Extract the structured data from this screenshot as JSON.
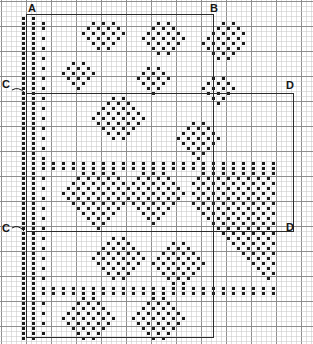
{
  "chart": {
    "type": "needlework-grid-chart",
    "width_px": 313,
    "height_px": 344,
    "cell_px": 5,
    "heavy_line_every": 5,
    "colors": {
      "background": "#ffffff",
      "fine_grid": "#c9c9c9",
      "heavy_grid": "#8a8a8a",
      "stitch": "#1a1a1a",
      "outline": "#2b2b2b",
      "label": "#161616"
    },
    "grid": {
      "cols": 62,
      "rows": 68,
      "origin_x": 1,
      "origin_y": 1
    }
  },
  "labels": [
    {
      "id": "label-a",
      "text": "A",
      "x": 28,
      "y": 3,
      "leader": null
    },
    {
      "id": "label-b",
      "text": "B",
      "x": 210,
      "y": 3,
      "leader": null
    },
    {
      "id": "label-c-top",
      "text": "C",
      "x": 2,
      "y": 79,
      "leader": {
        "x1": 12,
        "y1": 90,
        "x2": 25,
        "y2": 93
      }
    },
    {
      "id": "label-d-top",
      "text": "D",
      "x": 286,
      "y": 80,
      "leader": null
    },
    {
      "id": "label-c-bottom",
      "text": "C",
      "x": 2,
      "y": 223,
      "leader": {
        "x1": 12,
        "y1": 228,
        "x2": 24,
        "y2": 231
      }
    },
    {
      "id": "label-d-bottom",
      "text": "D",
      "x": 286,
      "y": 222,
      "leader": null
    }
  ],
  "outlines": [
    {
      "id": "outline-main-upper",
      "x": 26,
      "y": 14,
      "w": 187,
      "h": 79
    },
    {
      "id": "outline-middle-left",
      "x": 26,
      "y": 93,
      "w": 187,
      "h": 138
    },
    {
      "id": "outline-right-block",
      "x": 213,
      "y": 93,
      "w": 80,
      "h": 138
    },
    {
      "id": "outline-lower-left",
      "x": 26,
      "y": 231,
      "w": 187,
      "h": 106
    }
  ],
  "chart_data": {
    "type": "heatmap",
    "xlabel": "",
    "ylabel": "",
    "legend": [
      "A",
      "B",
      "C",
      "D"
    ],
    "cols": 62,
    "rows": 68,
    "cell_value_meaning": {
      "1": "filled stitch",
      "0": "empty"
    },
    "rows_data": [
      "00000000000000000000000000000000000000000000000000000000000000",
      "00000000000000000000000000000000000000000000000000000000000000",
      "00000000000000000000000000000000000000000000000000000000000000",
      "00001010000000000000000000000000000000000000000000000000000000",
      "00001010100000000010101000000001010000000000101000000000000000",
      "00001010100000000101010100000010101000000001010100000000000000",
      "00001010000000001010101010000101010100000010101010000000000000",
      "00001010100000000101010100001010101010000101010100000000000000",
      "00001010000000000010101000000101010100001010101010000000000000",
      "00001010100000000001010000000010101000000101010100000000000000",
      "00001010000000000000000000000001010000000010101000000000000000",
      "00001010100000000000000000000000000000000001010000000000000000",
      "00001010000000101000000000000000000000000000000000000000000000",
      "00001010100001010100000000000101000000000000000000000000000000",
      "00001010000010101010000000001010100000000000000000000000000000",
      "00001010100001010100000000010101010000000010100000000000000000",
      "00001010000000101000000000001010100000000101010000000000000000",
      "00001010100000010000000000000101000000001010101000000000000000",
      "00001010000000000000000000000010000000000101010000000000000000",
      "00001010100000000000001010000000000000000010100000000000000000",
      "00001010000000000000010101000000000000000001000000000000000000",
      "00001010100000000000101010100000000000000000000000000000000000",
      "00001010000000000001010101010000000000000000000000000000000000",
      "00001010100000000010101010101000000000000000000000000000000000",
      "00001010000000000001010101010000000000101000000000000000000000",
      "00001010100000000000101010100000000001010100000000000000000000",
      "00001010000000000000010101000000000010101010000000000000000000",
      "00001010100000000000001010000000000101010101000000000000000000",
      "00001010000000000000000000000000000010101010000000000000000000",
      "00001010100000000000000000000000000001010100000000000000000000",
      "00001010000000000000000000000000000000101000000000000000000000",
      "00001010100000000000000000000000000000010000000000000000000000",
      "00001010101010101010101010101010101010101010101010101010000000",
      "00001010101010101010101010101010101010101010101010101010000000",
      "00001010000000001010101000001010100000001010101010101010000000",
      "00001010100000010101010100010101010000010101010101010100000000",
      "00001010000000101010101010101010101000101010101010101010000000",
      "00001010100001010101010101010101010100010101010101010100000000",
      "00001010000010101010101010101010101010101010101010101010000000",
      "00001010100001010101010101010101010100010101010101010100000000",
      "00001010000000101010101010101010101000101010101010101010000000",
      "00001010100000010101010100010101010000010101010101010100000000",
      "00001010000000001010101000001010100000001010101010101010000000",
      "00001010100000000101010000000101000000000101010101010100000000",
      "00001010000000000010100000000010000000000010101010101010000000",
      "00001010100000000001000000000000000000000001010101010100000000",
      "00001010000000000000000000000000000000000000101010101010000000",
      "00001010100000000000001010000000000000000000010101010100000000",
      "00001010000000000000010101000000001010000000001010101010000000",
      "00001010100000000000101010100000010101000000000101010100000000",
      "00001010000000000001010101010000101010100000000010101010000000",
      "00001010100000000010101010101001010101010000000001010100000000",
      "00001010000000000001010101010010101010101000000000101010000000",
      "00001010100000000000101010100001010101010000000000010100000000",
      "00001010000000000000010101000000101010100000000000001010000000",
      "00001010100000000000001010000000010101000000000000000100000000",
      "00001010000000000000000000000000001010000000000000000000000000",
      "00001010101010101010101010101010101010101010101010101010000000",
      "00001010101010101010101010101010101010101010101010101010000000",
      "00001010000000001010000000000010100000000000000000000000000000",
      "00001010100000010101000000000101010000000000000000000000000000",
      "00001010000000101010100000001010101000000000000000000000000000",
      "00001010100001010101010000010101010100000000000000000000000000",
      "00001010000010101010101000101010101010000000000000000000000000",
      "00001010100001010101010000010101010100000000000000000000000000",
      "00001010000000101010100000001010101000000000000000000000000000",
      "00001010100000010101000000000101010000000000000000000000000000",
      "00001010000000001010000000000010100000000000000000000000000000"
    ]
  }
}
